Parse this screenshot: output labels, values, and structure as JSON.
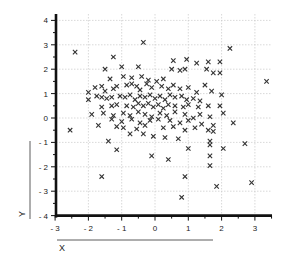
{
  "chart_data": {
    "type": "scatter",
    "title": "",
    "xlabel": "X",
    "ylabel": "Y",
    "xlim": [
      -3,
      3.6
    ],
    "ylim": [
      -4,
      4.3
    ],
    "grid": true,
    "legend": null,
    "marker": "x",
    "x_ticks": [
      -3,
      -2,
      -1,
      0,
      1,
      2,
      3
    ],
    "y_ticks": [
      -4,
      -3,
      -2,
      -1,
      0,
      1,
      2,
      3,
      4
    ],
    "x_tick_labels": [
      "- 3",
      "- 2",
      "- 1",
      "0",
      "1",
      "2",
      "3"
    ],
    "y_tick_labels": [
      "- 4",
      "- 3",
      "- 2",
      "- 1",
      "0",
      "1",
      "2",
      "3",
      "4"
    ],
    "points": [
      [
        -2.4,
        2.7
      ],
      [
        -1.25,
        2.5
      ],
      [
        -0.35,
        3.1
      ],
      [
        2.25,
        2.85
      ],
      [
        3.35,
        1.5
      ],
      [
        -1.5,
        2.0
      ],
      [
        -1.0,
        2.1
      ],
      [
        -0.5,
        2.1
      ],
      [
        0.55,
        2.35
      ],
      [
        0.95,
        2.4
      ],
      [
        1.25,
        2.25
      ],
      [
        1.6,
        2.3
      ],
      [
        1.95,
        2.3
      ],
      [
        -1.35,
        1.6
      ],
      [
        -0.95,
        1.7
      ],
      [
        -0.7,
        1.65
      ],
      [
        -0.4,
        1.7
      ],
      [
        -0.2,
        1.55
      ],
      [
        0.25,
        1.6
      ],
      [
        0.5,
        2.0
      ],
      [
        0.75,
        1.95
      ],
      [
        0.9,
        2.0
      ],
      [
        1.55,
        2.0
      ],
      [
        1.75,
        1.85
      ],
      [
        1.95,
        1.85
      ],
      [
        -2.0,
        1.05
      ],
      [
        -1.8,
        1.25
      ],
      [
        -1.6,
        1.3
      ],
      [
        -1.5,
        1.1
      ],
      [
        -1.25,
        1.2
      ],
      [
        -1.15,
        1.3
      ],
      [
        -0.85,
        1.35
      ],
      [
        -0.7,
        1.4
      ],
      [
        -0.55,
        1.3
      ],
      [
        -0.45,
        1.15
      ],
      [
        -0.25,
        1.4
      ],
      [
        -0.1,
        1.25
      ],
      [
        0.05,
        1.5
      ],
      [
        0.2,
        1.3
      ],
      [
        0.4,
        1.2
      ],
      [
        0.55,
        1.35
      ],
      [
        0.75,
        1.2
      ],
      [
        1.0,
        1.25
      ],
      [
        1.25,
        1.05
      ],
      [
        1.5,
        1.35
      ],
      [
        1.7,
        1.1
      ],
      [
        2.0,
        0.95
      ],
      [
        -1.75,
        0.9
      ],
      [
        -1.6,
        0.85
      ],
      [
        -1.45,
        0.8
      ],
      [
        -1.3,
        0.85
      ],
      [
        -1.05,
        0.9
      ],
      [
        -0.9,
        0.85
      ],
      [
        -0.75,
        0.95
      ],
      [
        -0.6,
        0.75
      ],
      [
        -0.45,
        0.9
      ],
      [
        -0.3,
        0.85
      ],
      [
        -0.15,
        0.95
      ],
      [
        0.0,
        0.8
      ],
      [
        0.15,
        0.9
      ],
      [
        0.3,
        0.75
      ],
      [
        0.45,
        0.95
      ],
      [
        0.6,
        0.85
      ],
      [
        0.8,
        0.9
      ],
      [
        0.95,
        0.75
      ],
      [
        1.15,
        0.8
      ],
      [
        1.35,
        0.7
      ],
      [
        -2.0,
        0.75
      ],
      [
        -1.6,
        0.45
      ],
      [
        -1.3,
        0.5
      ],
      [
        -1.15,
        0.55
      ],
      [
        -0.85,
        0.5
      ],
      [
        -0.65,
        0.45
      ],
      [
        -0.5,
        0.6
      ],
      [
        -0.35,
        0.5
      ],
      [
        -0.2,
        0.6
      ],
      [
        -0.05,
        0.45
      ],
      [
        0.1,
        0.55
      ],
      [
        0.25,
        0.4
      ],
      [
        0.4,
        0.55
      ],
      [
        0.6,
        0.5
      ],
      [
        0.85,
        0.45
      ],
      [
        1.0,
        0.55
      ],
      [
        1.3,
        0.45
      ],
      [
        1.6,
        0.5
      ],
      [
        1.95,
        0.5
      ],
      [
        -1.9,
        0.15
      ],
      [
        -1.55,
        0.2
      ],
      [
        -1.25,
        0.1
      ],
      [
        -0.95,
        0.2
      ],
      [
        -0.75,
        0.1
      ],
      [
        -0.5,
        0.25
      ],
      [
        -0.3,
        0.15
      ],
      [
        -0.1,
        0.05
      ],
      [
        0.15,
        0.2
      ],
      [
        0.35,
        0.1
      ],
      [
        0.6,
        0.25
      ],
      [
        0.9,
        0.15
      ],
      [
        1.15,
        0.0
      ],
      [
        1.35,
        0.15
      ],
      [
        1.65,
        0.05
      ],
      [
        2.05,
        0.2
      ],
      [
        -2.55,
        -0.5
      ],
      [
        -1.3,
        -0.05
      ],
      [
        -1.0,
        -0.15
      ],
      [
        -0.7,
        -0.05
      ],
      [
        -0.45,
        -0.2
      ],
      [
        -0.15,
        -0.1
      ],
      [
        0.1,
        -0.05
      ],
      [
        0.45,
        -0.1
      ],
      [
        0.75,
        -0.2
      ],
      [
        1.0,
        -0.1
      ],
      [
        1.4,
        -0.25
      ],
      [
        1.75,
        -0.3
      ],
      [
        2.35,
        -0.2
      ],
      [
        -1.7,
        -0.3
      ],
      [
        -1.15,
        -0.35
      ],
      [
        -0.95,
        -0.4
      ],
      [
        -0.55,
        -0.45
      ],
      [
        -0.3,
        -0.3
      ],
      [
        0.25,
        -0.4
      ],
      [
        0.55,
        -0.35
      ],
      [
        0.9,
        -0.5
      ],
      [
        1.2,
        -0.4
      ],
      [
        1.6,
        -0.5
      ],
      [
        1.75,
        -0.55
      ],
      [
        -1.4,
        -0.95
      ],
      [
        -1.15,
        -1.3
      ],
      [
        -0.75,
        -0.65
      ],
      [
        -0.35,
        -0.65
      ],
      [
        -0.05,
        -0.75
      ],
      [
        0.3,
        -0.8
      ],
      [
        0.7,
        -0.85
      ],
      [
        1.0,
        -1.25
      ],
      [
        1.65,
        -1.1
      ],
      [
        2.05,
        -1.25
      ],
      [
        2.7,
        -1.05
      ],
      [
        1.65,
        -0.95
      ],
      [
        -0.1,
        -1.55
      ],
      [
        0.4,
        -1.7
      ],
      [
        1.65,
        -1.55
      ],
      [
        1.65,
        -1.95
      ],
      [
        -1.6,
        -2.4
      ],
      [
        0.9,
        -2.4
      ],
      [
        1.85,
        -2.8
      ],
      [
        2.9,
        -2.65
      ],
      [
        0.8,
        -3.25
      ]
    ]
  }
}
